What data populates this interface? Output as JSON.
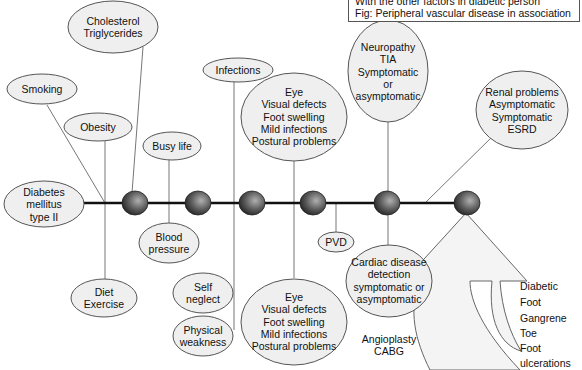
{
  "caption": {
    "line1": "With the other factors in diabetic person",
    "line2": "Fig: Peripheral vascular disease in association"
  },
  "nodes": {
    "cholesterol": [
      "Cholesterol",
      "Triglycerides"
    ],
    "smoking": [
      "Smoking"
    ],
    "obesity": [
      "Obesity"
    ],
    "diabetes": [
      "Diabetes",
      "mellitus",
      "type II"
    ],
    "diet": [
      "Diet",
      "Exercise"
    ],
    "busy_life": [
      "Busy life"
    ],
    "blood_pressure": [
      "Blood",
      "pressure"
    ],
    "infections": [
      "Infections"
    ],
    "self_neglect": [
      "Self",
      "neglect"
    ],
    "physical_weakness": [
      "Physical",
      "weakness"
    ],
    "eye_top": [
      "Eye",
      "Visual defects",
      "Foot swelling",
      "Mild infections",
      "Postural problems"
    ],
    "eye_bottom": [
      "Eye",
      "Visual defects",
      "Foot swelling",
      "Mild infections",
      "Postural problems"
    ],
    "pvd": [
      "PVD"
    ],
    "neuropathy": [
      "Neuropathy",
      "TIA",
      "Symptomatic",
      "or",
      "asymptomatic"
    ],
    "cardiac": [
      "Cardiac disease",
      "detection",
      "symptomatic or",
      "asymptomatic"
    ],
    "angioplasty": [
      "Angioplasty",
      "CABG"
    ],
    "renal": [
      "Renal problems",
      "Asymptomatic",
      "Symptomatic",
      "ESRD"
    ]
  },
  "foot_labels": [
    "Diabetic",
    "Foot",
    "Gangrene",
    "Toe",
    "Foot",
    "ulcerations"
  ],
  "colors": {
    "ellipse_fill": "#efefef",
    "ellipse_stroke": "#555555",
    "line": "#777777",
    "axis": "#111111",
    "dot_dark": "#2a2a2a",
    "dot_light": "#a8a8a8",
    "arrow_fill": "#f4f4f4"
  }
}
